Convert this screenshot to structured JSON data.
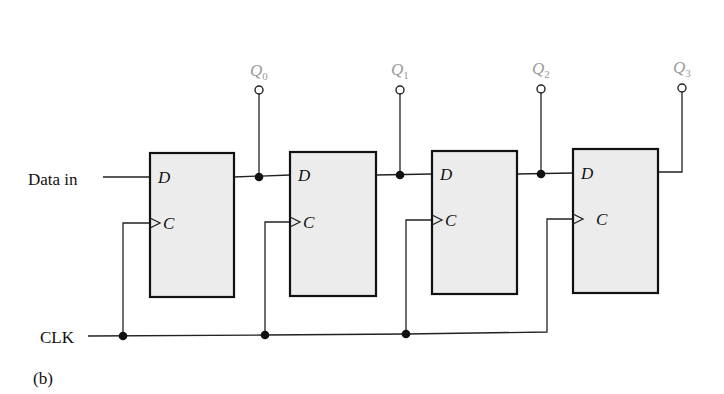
{
  "diagram": {
    "type": "4-bit serial-in parallel-out shift register (D flip-flops)",
    "caption": "(b)",
    "inputs": {
      "data_in_label": "Data in",
      "clock_label": "CLK"
    },
    "flip_flops": [
      {
        "id": "FF0",
        "d_label": "D",
        "c_label": "C",
        "output": "Q0"
      },
      {
        "id": "FF1",
        "d_label": "D",
        "c_label": "C",
        "output": "Q1"
      },
      {
        "id": "FF2",
        "d_label": "D",
        "c_label": "C",
        "output": "Q2"
      },
      {
        "id": "FF3",
        "d_label": "D",
        "c_label": "C",
        "output": "Q3"
      }
    ],
    "outputs": [
      {
        "name": "Q",
        "sub": "0"
      },
      {
        "name": "Q",
        "sub": "1"
      },
      {
        "name": "Q",
        "sub": "2"
      },
      {
        "name": "Q",
        "sub": "3"
      }
    ],
    "connections": [
      "Data in -> FF0.D",
      "FF0.Q -> Q0, FF1.D",
      "FF1.Q -> Q1, FF2.D",
      "FF2.Q -> Q2, FF3.D",
      "FF3.Q -> Q3",
      "CLK -> FF0.C, FF1.C, FF2.C, FF3.C"
    ],
    "colors": {
      "box_fill": "#ececec",
      "stroke": "#111111",
      "output_label": "#9a9a9a"
    }
  }
}
